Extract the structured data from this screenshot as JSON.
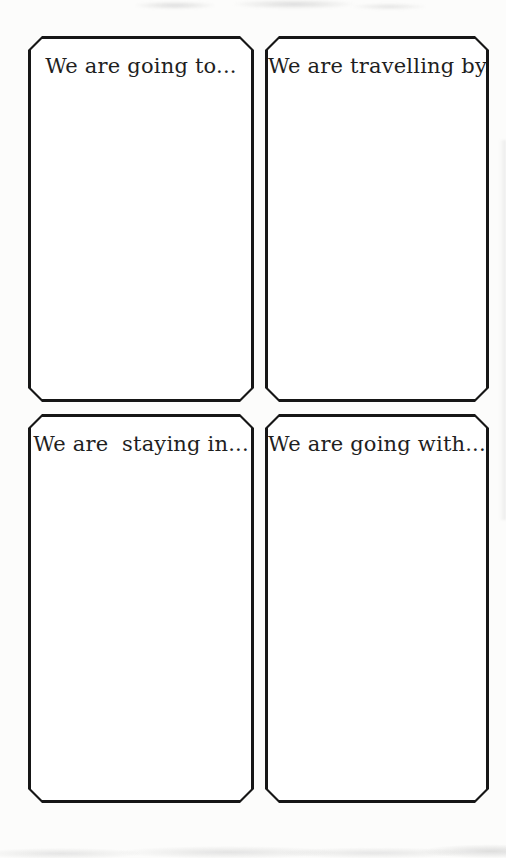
{
  "cards": [
    {
      "label": "We are going to..."
    },
    {
      "label": "We are travelling by..."
    },
    {
      "label": "We are  staying in..."
    },
    {
      "label": "We are going with..."
    }
  ],
  "colors": {
    "page_background": "#fcfcfb",
    "card_background": "#ffffff",
    "card_border": "#161616",
    "label_text": "#1f1f1f"
  }
}
